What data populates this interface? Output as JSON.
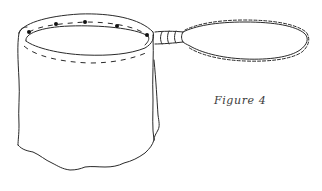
{
  "figure": {
    "caption": "Figure 4",
    "ink_color": "#2a2a2a",
    "background": "#ffffff",
    "parts": {
      "rim_dots_count": 5,
      "has_dashed_stitch_line": true,
      "has_ferrule": true,
      "has_twisted_wire_loop": true
    }
  }
}
